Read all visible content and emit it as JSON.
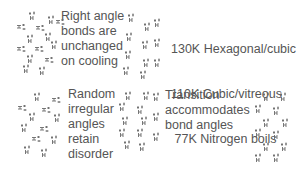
{
  "panels": {
    "top_left": {
      "lines": [
        "Right angle",
        "bonds are",
        "unchanged",
        "on cooling"
      ]
    },
    "top_right": {
      "lines": [
        "130K Hexagonal/cubic",
        "110K Cubic/vitreous",
        " 77K Nitrogen boils",
        " 72K Ferroelectric"
      ]
    },
    "bottom_left": {
      "lines": [
        "Random",
        "irregular",
        "angles",
        "retain",
        "disorder"
      ]
    },
    "bottom_right": {
      "lines": [
        "Transition",
        "accommodates",
        "bond angles"
      ]
    }
  },
  "icons": {
    "molecule": "water-molecule-icon"
  },
  "colors": {
    "text": "#555555",
    "glyph": "#666666",
    "background": "#ffffff"
  }
}
